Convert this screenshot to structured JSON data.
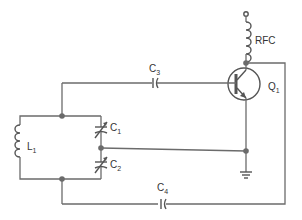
{
  "diagram": {
    "type": "circuit-schematic",
    "colors": {
      "wire": "#6b6b6b",
      "background": "#ffffff",
      "text": "#333333"
    },
    "components": {
      "rfc": {
        "label": "RFC"
      },
      "q1": {
        "letter": "Q",
        "sub": "1"
      },
      "c3": {
        "letter": "C",
        "sub": "3"
      },
      "c4": {
        "letter": "C",
        "sub": "4"
      },
      "l1": {
        "letter": "L",
        "sub": "1"
      },
      "c1": {
        "letter": "C",
        "sub": "1"
      },
      "c2": {
        "letter": "C",
        "sub": "2"
      }
    }
  }
}
